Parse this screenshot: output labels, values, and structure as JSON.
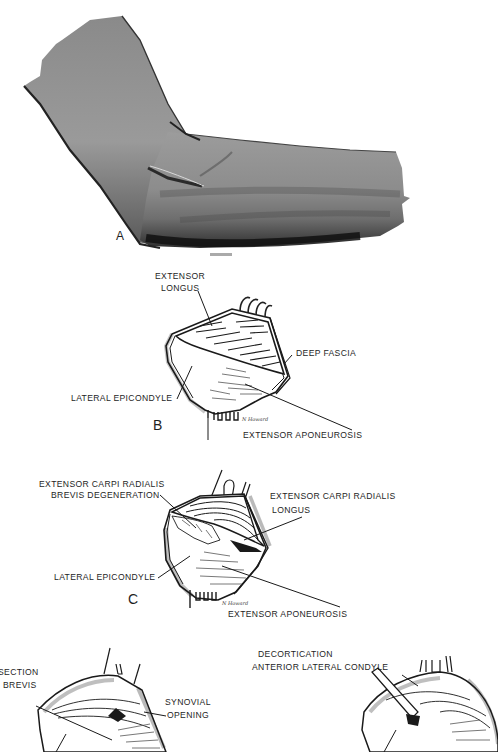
{
  "figure": {
    "panels": [
      {
        "id": "A",
        "letter": "A",
        "description": "Elbow showing lateral skin incision"
      },
      {
        "id": "B",
        "letter": "B",
        "labels": {
          "extensor_longus_1": "EXTENSOR",
          "extensor_longus_2": "LONGUS",
          "deep_fascia": "DEEP FASCIA",
          "lateral_epicondyle": "LATERAL EPICONDYLE",
          "extensor_aponeurosis": "EXTENSOR APONEUROSIS"
        },
        "signature": "N Howard"
      },
      {
        "id": "C",
        "letter": "C",
        "labels": {
          "ecrb_degeneration_1": "EXTENSOR CARPI RADIALIS",
          "ecrb_degeneration_2": "BREVIS  DEGENERATION",
          "ecrl_1": "EXTENSOR CARPI RADIALIS",
          "ecrl_2": "LONGUS",
          "lateral_epicondyle": "LATERAL EPICONDYLE",
          "extensor_aponeurosis": "EXTENSOR APONEUROSIS"
        },
        "signature": "N Howard"
      },
      {
        "id": "D",
        "labels": {
          "section_brevis_1": "SECTION",
          "section_brevis_2": "BREVIS",
          "synovial_opening_1": "SYNOVIAL",
          "synovial_opening_2": "OPENING"
        }
      },
      {
        "id": "E",
        "labels": {
          "decortication_1": "DECORTICATION",
          "decortication_2": "ANTERIOR LATERAL CONDYLE"
        }
      }
    ]
  }
}
